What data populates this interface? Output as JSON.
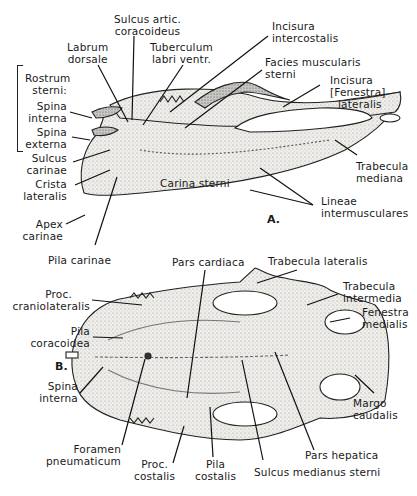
{
  "figure": {
    "panels": [
      {
        "id": "A",
        "label": "A.",
        "view": "lateral",
        "labels": {
          "sulcus_artic": [
            "Sulcus artic.",
            "coracoideus"
          ],
          "labrum_dorsale": [
            "Labrum",
            "dorsale"
          ],
          "tuberculum": [
            "Tuberculum",
            "labri ventr."
          ],
          "incisura_intercostalis": [
            "Incisura",
            "intercostalis"
          ],
          "facies_muscularis": [
            "Facies muscularis",
            "sterni"
          ],
          "rostrum_sterni": [
            "Rostrum",
            "sterni:"
          ],
          "spina_interna": [
            "Spina",
            "interna"
          ],
          "spina_externa": [
            "Spina",
            "externa"
          ],
          "incisura_fenestra": [
            "Incisura",
            "[Fenestra]",
            "lateralis"
          ],
          "sulcus_carinae": [
            "Sulcus",
            "carinae"
          ],
          "crista_lateralis": [
            "Crista",
            "lateralis"
          ],
          "trabecula_mediana": [
            "Trabecula",
            "mediana"
          ],
          "carina_sterni": "Carina sterni",
          "lineae_intermusculares": [
            "Lineae",
            "intermusculares"
          ],
          "apex_carinae": [
            "Apex",
            "carinae"
          ],
          "pila_carinae": "Pila carinae"
        }
      },
      {
        "id": "B",
        "label": "B.",
        "view": "dorsal",
        "labels": {
          "pars_cardiaca": "Pars cardiaca",
          "trabecula_lateralis": "Trabecula lateralis",
          "proc_craniolateralis": [
            "Proc.",
            "craniolateralis"
          ],
          "trabecula_intermedia": [
            "Trabecula",
            "intermedia"
          ],
          "pila_coracoidea": [
            "Pila",
            "coracoidea"
          ],
          "fenestra_medialis": [
            "Fenestra",
            "medialis"
          ],
          "spina_interna": [
            "Spina",
            "interna"
          ],
          "margo_caudalis": [
            "Margo",
            "caudalis"
          ],
          "foramen_pneumaticum": [
            "Foramen",
            "pneumaticum"
          ],
          "pars_hepatica": "Pars hepatica",
          "proc_costalis": [
            "Proc.",
            "costalis"
          ],
          "pila_costalis": [
            "Pila",
            "costalis"
          ],
          "sulcus_medianus": "Sulcus medianus sterni"
        }
      }
    ]
  },
  "colors": {
    "ink": "#1a1a1a",
    "bone_fill": "#ecebe8",
    "bone_shade": "#9a9894",
    "background": "#ffffff"
  }
}
